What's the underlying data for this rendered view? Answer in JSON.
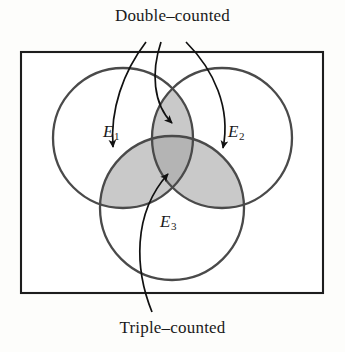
{
  "figure": {
    "type": "venn-diagram-inclusion-exclusion",
    "background_color": "#fdfdfb",
    "stroke_color": "#333333",
    "captions": {
      "top": "Double–counted",
      "bottom": "Triple–counted"
    },
    "sets": [
      {
        "id": "E1",
        "base": "E",
        "subscript": "1",
        "cx": 123,
        "cy": 138,
        "r": 70
      },
      {
        "id": "E2",
        "base": "E",
        "subscript": "2",
        "cx": 222,
        "cy": 138,
        "r": 70
      },
      {
        "id": "E3",
        "base": "E",
        "subscript": "3",
        "cx": 172,
        "cy": 208,
        "r": 72
      }
    ],
    "universe_rect": {
      "x": 21,
      "y": 52,
      "width": 302,
      "height": 241
    },
    "shading": {
      "pairwise_fill": "#c9c9c9",
      "triple_fill": "#b4b4b4"
    },
    "annotations": [
      {
        "name": "arrow-double-e1-e3",
        "label": "Double–counted",
        "target_region": "E1 ∩ E3"
      },
      {
        "name": "arrow-double-e1-e2",
        "label": "Double–counted",
        "target_region": "E1 ∩ E2"
      },
      {
        "name": "arrow-double-e2-e3",
        "label": "Double–counted",
        "target_region": "E2 ∩ E3"
      },
      {
        "name": "arrow-triple",
        "label": "Triple–counted",
        "target_region": "E1 ∩ E2 ∩ E3"
      }
    ]
  }
}
